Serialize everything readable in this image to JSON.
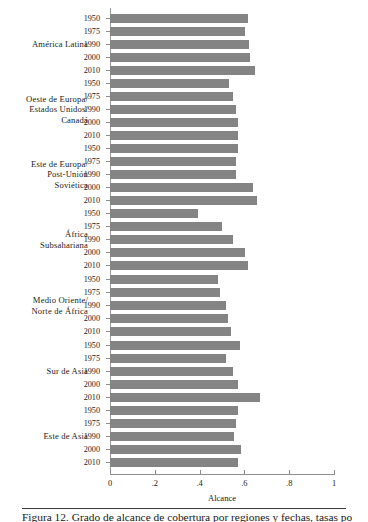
{
  "chart_data": {
    "type": "bar",
    "orientation": "horizontal",
    "title": "",
    "xlabel": "Alcance",
    "ylabel": "",
    "xlim": [
      0,
      1
    ],
    "xticks": [
      "0",
      ".2",
      ".4",
      ".6",
      ".8",
      "1"
    ],
    "xtick_values": [
      0,
      0.2,
      0.4,
      0.6,
      0.8,
      1
    ],
    "grid": false,
    "legend": false,
    "bar_color": "#848484",
    "axis_color": "#8e8e8e",
    "categories": [
      "1950",
      "1975",
      "1990",
      "2000",
      "2010"
    ],
    "groups": [
      {
        "label": "América Latina",
        "label_lines": [
          "América Latina"
        ],
        "values": [
          0.616,
          0.603,
          0.62,
          0.625,
          0.647
        ]
      },
      {
        "label": "Oeste de Europa/ Estados Unidos/ Canadá",
        "label_lines": [
          "Oeste de Europa/",
          "Estados Unidos/",
          "Canadá"
        ],
        "values": [
          0.531,
          0.549,
          0.563,
          0.571,
          0.571
        ]
      },
      {
        "label": "Este de Europa/ Post-Unión Soviética",
        "label_lines": [
          "Este de Europa/",
          "Post-Unión",
          "Soviética"
        ],
        "values": [
          0.571,
          0.563,
          0.563,
          0.638,
          0.656
        ]
      },
      {
        "label": "África Subsahariana",
        "label_lines": [
          "África",
          "Subsahariana"
        ],
        "values": [
          0.393,
          0.5,
          0.549,
          0.603,
          0.616
        ]
      },
      {
        "label": "Medio Oriente/ Norte de África",
        "label_lines": [
          "Medio Oriente/",
          "Norte de África"
        ],
        "values": [
          0.482,
          0.491,
          0.518,
          0.527,
          0.54
        ]
      },
      {
        "label": "Sur de Asia",
        "label_lines": [
          "Sur de Asia"
        ],
        "values": [
          0.58,
          0.518,
          0.549,
          0.571,
          0.67
        ]
      },
      {
        "label": "Este de Asia",
        "label_lines": [
          "Este de Asia"
        ],
        "values": [
          0.571,
          0.563,
          0.554,
          0.585,
          0.571
        ]
      }
    ]
  },
  "caption": {
    "text": "Figura 12. Grado de alcance de cobertura por regiones y fechas, tasas ponderadas"
  }
}
